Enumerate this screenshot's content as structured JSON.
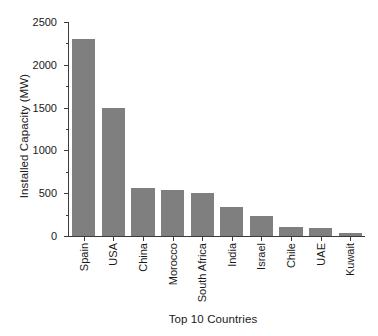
{
  "chart_data": {
    "type": "bar",
    "title": "",
    "xlabel": "Top 10 Countries",
    "ylabel": "Installed Capacity (MW)",
    "categories": [
      "Spain",
      "USA",
      "China",
      "Morocco",
      "South Africa",
      "India",
      "Israel",
      "Chile",
      "UAE",
      "Kuwait"
    ],
    "values": [
      2300,
      1495,
      565,
      540,
      505,
      340,
      235,
      100,
      90,
      35
    ],
    "series": [
      {
        "name": "Installed Capacity (MW)",
        "values": [
          2300,
          1495,
          565,
          540,
          505,
          340,
          235,
          100,
          90,
          35
        ]
      }
    ],
    "ylim": [
      0,
      2500
    ],
    "ytick_labels": [
      "0",
      "500",
      "1000",
      "1500",
      "2000",
      "2500"
    ],
    "ytick_values": [
      0,
      500,
      1000,
      1500,
      2000,
      2500
    ],
    "yminor_tick_values": [
      250,
      750,
      1250,
      1750,
      2250
    ],
    "grid": false,
    "legend": false,
    "legend_position": "none",
    "bar_color": "#7f7f7f",
    "axis_color": "#3b3b3b",
    "background_color": "#ffffff",
    "xtick_label_rotation": 90,
    "tick_direction": "out"
  }
}
